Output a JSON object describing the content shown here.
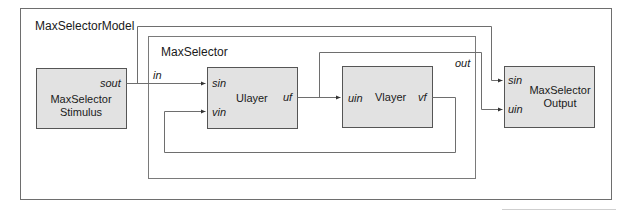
{
  "diagram": {
    "colors": {
      "line": "#6e6e6e",
      "block_fill": "#e2e2e2",
      "block_stroke": "#555555",
      "text": "#1a1a1a"
    },
    "containers": [
      {
        "id": "model",
        "label": "MaxSelectorModel"
      },
      {
        "id": "selector",
        "label": "MaxSelector",
        "ports": {
          "in": "in",
          "out": "out"
        }
      }
    ],
    "blocks": {
      "stimulus": {
        "title_line1": "MaxSelector",
        "title_line2": "Stimulus",
        "ports": {
          "sout": "sout"
        }
      },
      "ulayer": {
        "title": "Ulayer",
        "ports": {
          "sin": "sin",
          "vin": "vin",
          "uf": "uf"
        }
      },
      "vlayer": {
        "title": "Vlayer",
        "ports": {
          "uin": "uin",
          "vf": "vf"
        }
      },
      "output": {
        "title_line1": "MaxSelector",
        "title_line2": "Output",
        "ports": {
          "sin": "sin",
          "uin": "uin"
        }
      }
    },
    "connections": [
      {
        "from": "stimulus.sout",
        "to": "ulayer.sin"
      },
      {
        "from": "stimulus.sout",
        "to": "output.sin"
      },
      {
        "from": "ulayer.uf",
        "to": "vlayer.uin"
      },
      {
        "from": "ulayer.uf",
        "to": "output.uin"
      },
      {
        "from": "vlayer.vf",
        "to": "ulayer.vin"
      }
    ]
  }
}
